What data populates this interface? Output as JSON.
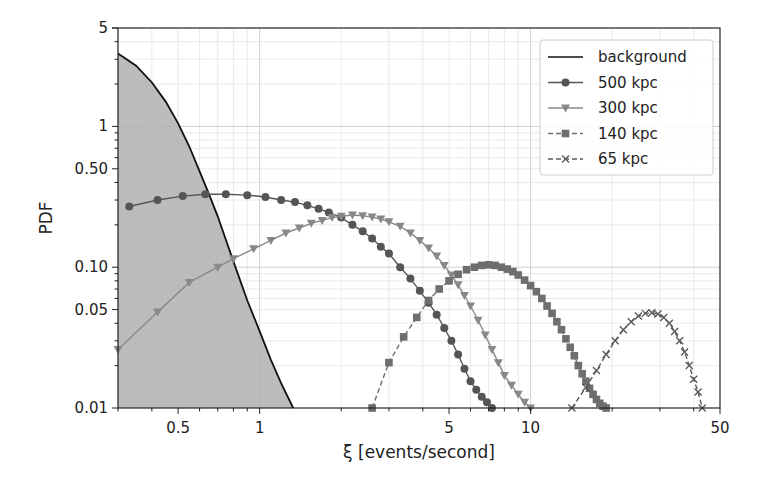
{
  "chart_data": {
    "type": "line",
    "title": "",
    "xlabel": "ξ [events/second]",
    "ylabel": "PDF",
    "xscale": "log",
    "yscale": "log",
    "xlim": [
      0.3,
      50
    ],
    "ylim": [
      0.01,
      5
    ],
    "grid": true,
    "legend_position": "upper right",
    "xticks": [
      {
        "value": 0.5,
        "label": "0.5"
      },
      {
        "value": 1,
        "label": "1"
      },
      {
        "value": 5,
        "label": "5"
      },
      {
        "value": 10,
        "label": "10"
      },
      {
        "value": 50,
        "label": "50"
      }
    ],
    "yticks": [
      {
        "value": 0.01,
        "label": "0.01"
      },
      {
        "value": 0.05,
        "label": "0.05"
      },
      {
        "value": 0.1,
        "label": "0.10"
      },
      {
        "value": 0.5,
        "label": "0.50"
      },
      {
        "value": 1,
        "label": "1"
      },
      {
        "value": 5,
        "label": "5"
      }
    ],
    "series": [
      {
        "name": "background",
        "color": "#111111",
        "style": "solid",
        "marker": "none",
        "fill": "#b0b0b0",
        "x": [
          0.3,
          0.35,
          0.4,
          0.45,
          0.5,
          0.55,
          0.6,
          0.65,
          0.7,
          0.8,
          0.9,
          1.0,
          1.1,
          1.2,
          1.33
        ],
        "y": [
          3.3,
          2.7,
          2.05,
          1.5,
          1.05,
          0.72,
          0.48,
          0.33,
          0.23,
          0.11,
          0.058,
          0.035,
          0.022,
          0.015,
          0.01
        ]
      },
      {
        "name": "500 kpc",
        "color": "#555555",
        "style": "solid",
        "marker": "circle",
        "x": [
          0.33,
          0.42,
          0.52,
          0.63,
          0.75,
          0.9,
          1.05,
          1.2,
          1.35,
          1.5,
          1.65,
          1.8,
          2.0,
          2.2,
          2.4,
          2.6,
          2.8,
          3.0,
          3.3,
          3.6,
          3.9,
          4.2,
          4.5,
          4.8,
          5.1,
          5.4,
          5.7,
          6.0,
          6.3,
          6.6,
          6.9,
          7.2
        ],
        "y": [
          0.27,
          0.3,
          0.32,
          0.33,
          0.33,
          0.325,
          0.315,
          0.3,
          0.29,
          0.275,
          0.26,
          0.245,
          0.225,
          0.2,
          0.18,
          0.16,
          0.14,
          0.125,
          0.1,
          0.083,
          0.068,
          0.056,
          0.046,
          0.037,
          0.03,
          0.024,
          0.019,
          0.0155,
          0.0135,
          0.012,
          0.011,
          0.01
        ]
      },
      {
        "name": "300 kpc",
        "color": "#888888",
        "style": "solid",
        "marker": "triangle-down",
        "x": [
          0.3,
          0.42,
          0.55,
          0.7,
          0.8,
          0.95,
          1.1,
          1.25,
          1.4,
          1.55,
          1.7,
          1.85,
          2.0,
          2.2,
          2.4,
          2.6,
          2.8,
          3.0,
          3.3,
          3.6,
          3.9,
          4.2,
          4.5,
          4.8,
          5.1,
          5.4,
          5.7,
          6.0,
          6.4,
          6.8,
          7.2,
          7.6,
          8.0,
          8.5,
          9.0,
          9.5,
          10.0
        ],
        "y": [
          0.026,
          0.048,
          0.078,
          0.1,
          0.115,
          0.135,
          0.155,
          0.175,
          0.19,
          0.205,
          0.215,
          0.225,
          0.23,
          0.235,
          0.232,
          0.227,
          0.22,
          0.21,
          0.195,
          0.175,
          0.155,
          0.137,
          0.12,
          0.103,
          0.088,
          0.075,
          0.063,
          0.053,
          0.042,
          0.033,
          0.026,
          0.021,
          0.017,
          0.0145,
          0.0125,
          0.011,
          0.01
        ]
      },
      {
        "name": "140 kpc",
        "color": "#6e6e6e",
        "style": "dashed",
        "marker": "square",
        "x": [
          2.6,
          3.0,
          3.4,
          3.8,
          4.2,
          4.6,
          5.0,
          5.4,
          5.8,
          6.2,
          6.6,
          7.0,
          7.4,
          7.8,
          8.2,
          8.6,
          9.0,
          9.5,
          10.0,
          10.5,
          11.0,
          11.5,
          12.0,
          12.5,
          13.0,
          13.5,
          14.0,
          14.5,
          15.0,
          15.5,
          16.0,
          16.5,
          17.0,
          17.5,
          18.0,
          18.5,
          19.0
        ],
        "y": [
          0.01,
          0.021,
          0.032,
          0.044,
          0.058,
          0.07,
          0.08,
          0.089,
          0.096,
          0.1,
          0.103,
          0.104,
          0.103,
          0.1,
          0.097,
          0.093,
          0.088,
          0.081,
          0.074,
          0.067,
          0.06,
          0.053,
          0.047,
          0.041,
          0.036,
          0.031,
          0.027,
          0.0235,
          0.02,
          0.0175,
          0.0155,
          0.0138,
          0.0125,
          0.0115,
          0.0108,
          0.0103,
          0.01
        ]
      },
      {
        "name": "65 kpc",
        "color": "#5a5a5a",
        "style": "dashed",
        "marker": "x",
        "x": [
          14.2,
          16.0,
          17.5,
          19.0,
          20.5,
          22.0,
          23.5,
          25.0,
          26.5,
          28.0,
          29.5,
          31.0,
          32.5,
          34.0,
          35.5,
          37.0,
          38.5,
          40.0,
          41.5,
          43.0
        ],
        "y": [
          0.01,
          0.014,
          0.0185,
          0.024,
          0.03,
          0.036,
          0.041,
          0.045,
          0.047,
          0.0475,
          0.0465,
          0.044,
          0.04,
          0.035,
          0.03,
          0.025,
          0.02,
          0.016,
          0.013,
          0.01
        ]
      }
    ]
  }
}
